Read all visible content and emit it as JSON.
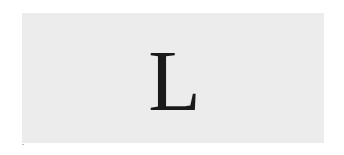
{
  "card": {
    "glyph": "L",
    "background_color": "#ececec",
    "glyph_color": "#1a1a1a"
  }
}
